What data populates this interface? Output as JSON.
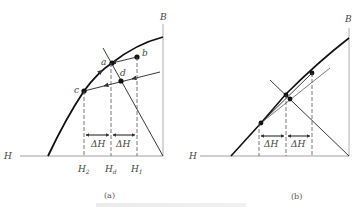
{
  "figure": {
    "panel_a": {
      "label": "(a)",
      "axis_x_label": "H",
      "axis_y_label": "B",
      "points": [
        "a",
        "b",
        "c",
        "d"
      ],
      "ticks": {
        "h2": "H",
        "h2_sub": "2",
        "hd": "H",
        "hd_sub": "d",
        "h1": "H",
        "h1_sub": "1"
      },
      "delta_left": "ΔH",
      "delta_right": "ΔH"
    },
    "panel_b": {
      "label": "(b)",
      "axis_x_label": "H",
      "axis_y_label": "B",
      "delta_left": "ΔH",
      "delta_right": "ΔH"
    },
    "colors": {
      "line": "#1a1a1a",
      "axis": "#9a9a9a",
      "dashed": "#666666"
    }
  }
}
